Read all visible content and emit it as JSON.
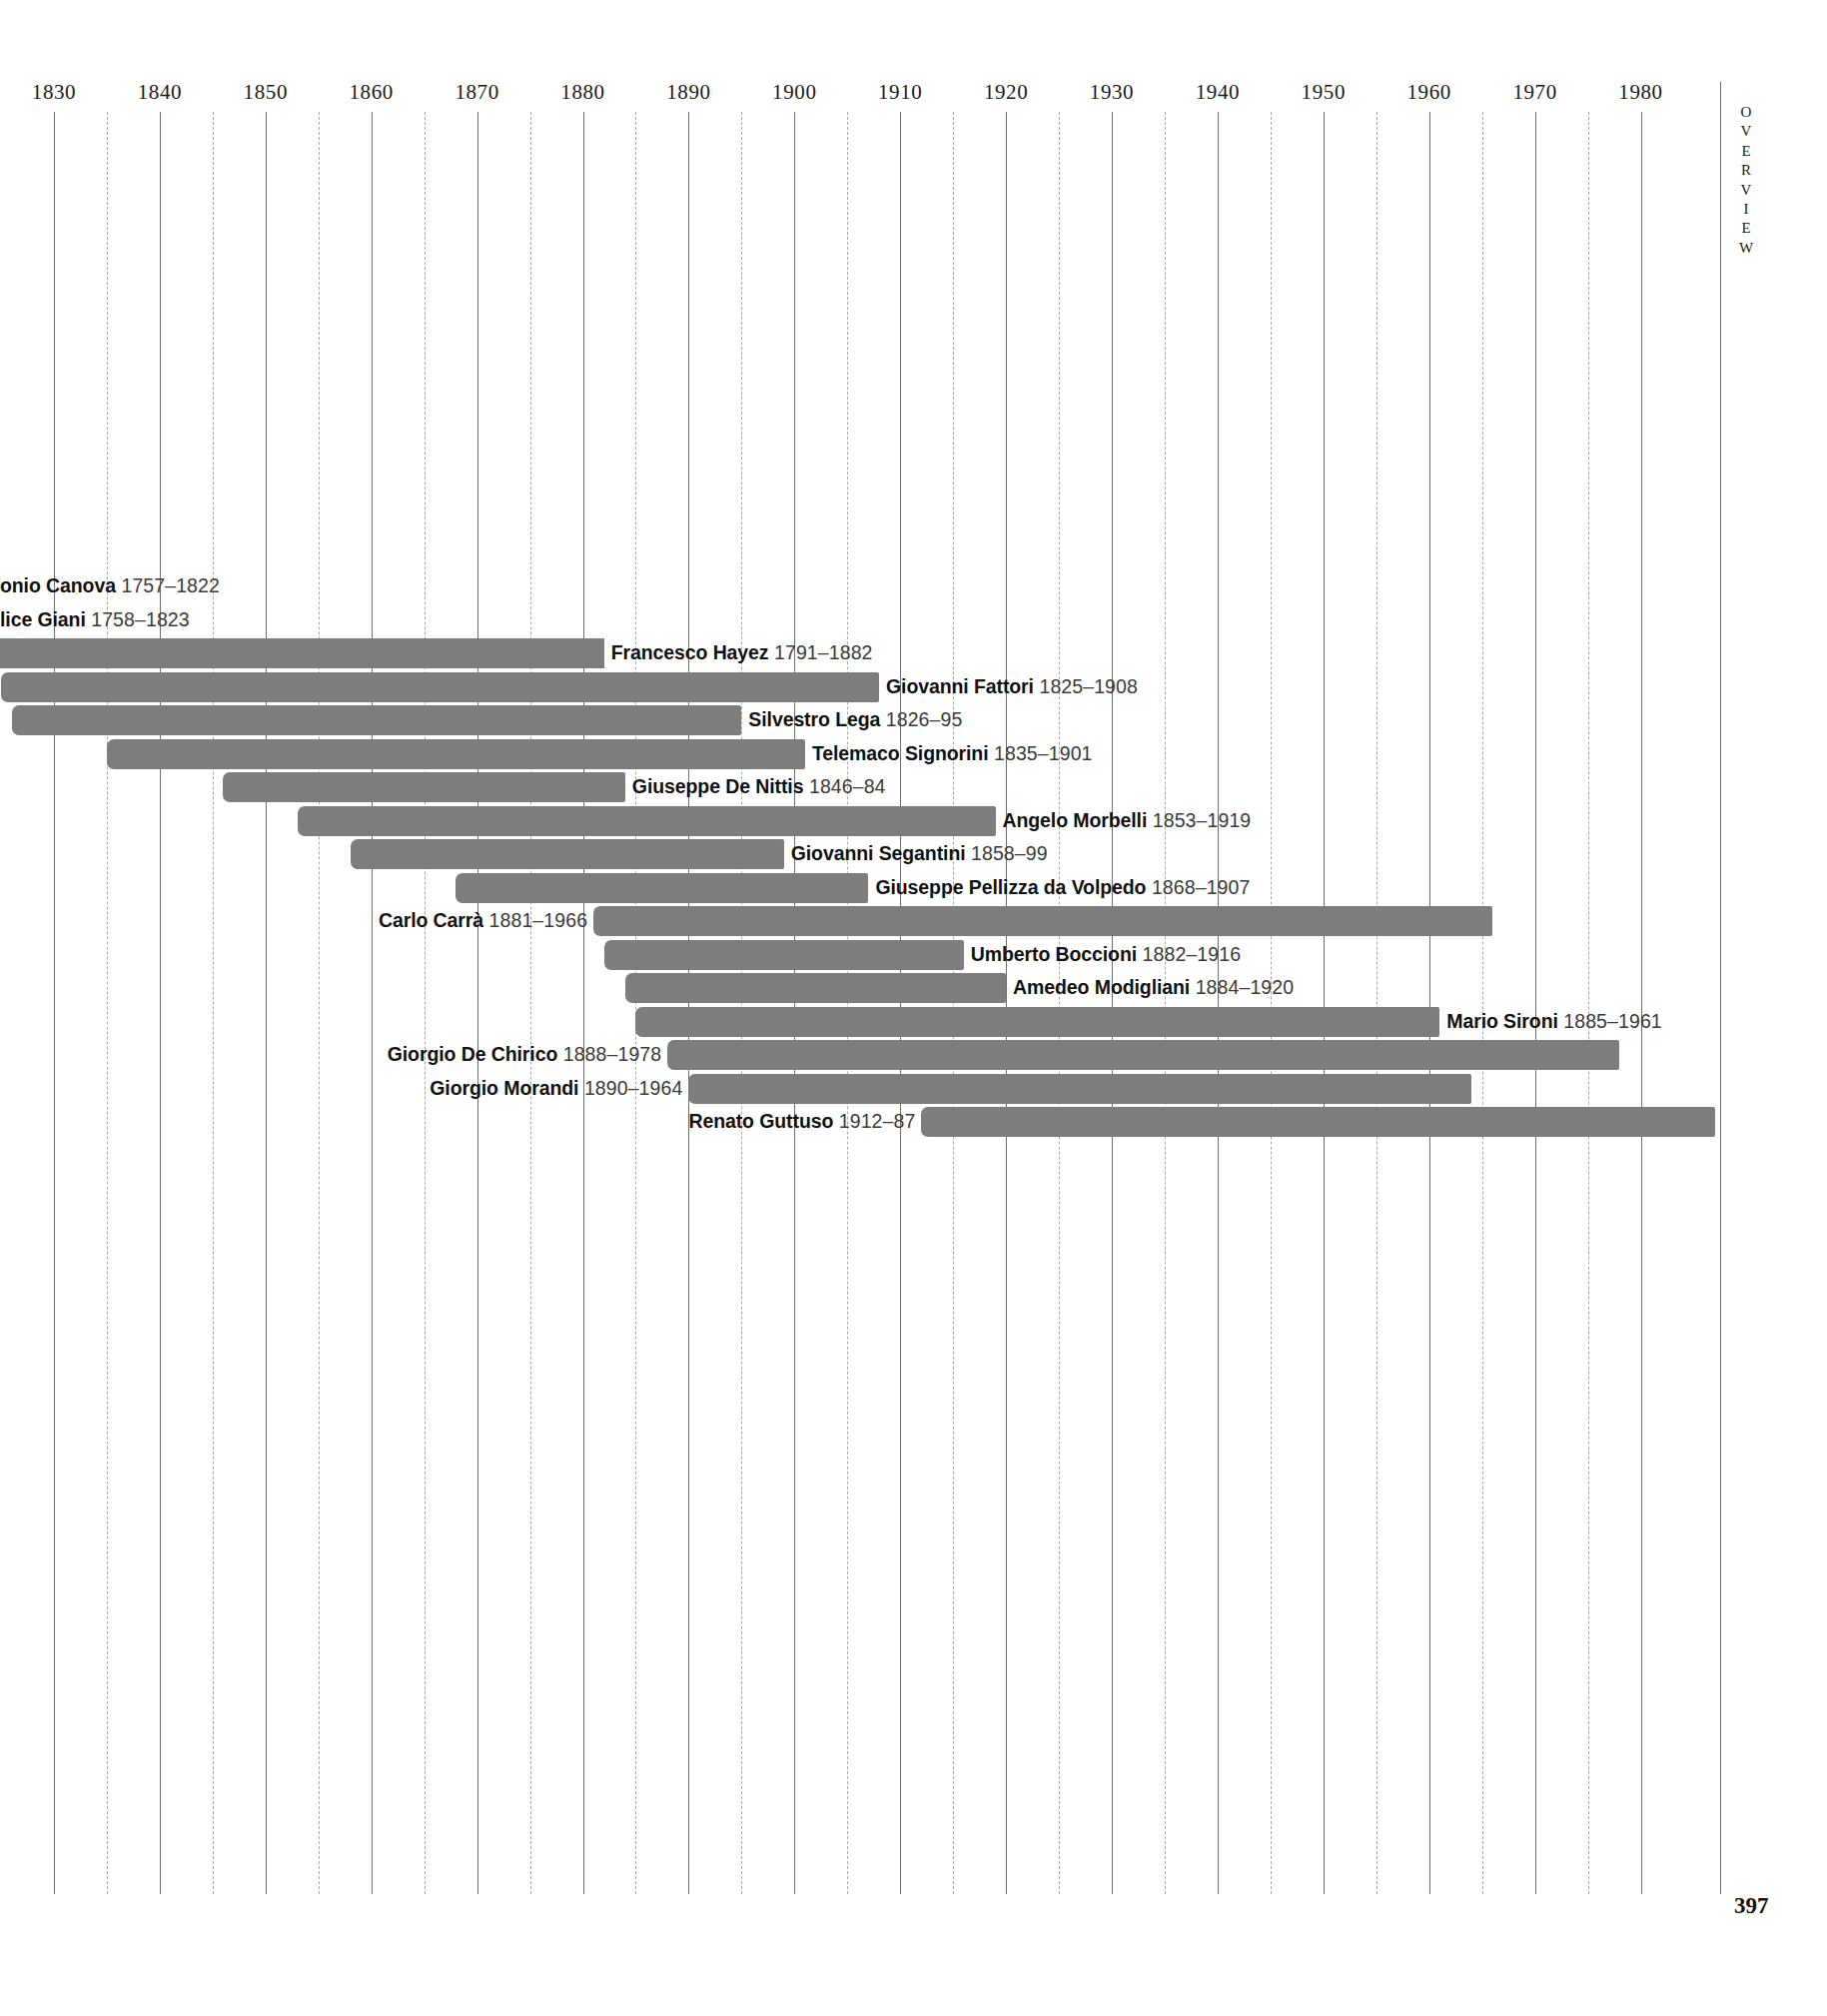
{
  "page": {
    "folio": "397",
    "running_head": "OVERVIEW"
  },
  "chart_data": {
    "type": "bar",
    "title": "",
    "subtitle": "",
    "xlabel": "",
    "ylabel": "",
    "orientation": "horizontal",
    "bar_meaning": "lifespan from birth year to death year",
    "grid": {
      "major_every": 10,
      "minor_every": 5,
      "major_style": "solid",
      "minor_style": "dashed"
    },
    "axis_ticks": [
      "1830",
      "1840",
      "1850",
      "1860",
      "1870",
      "1880",
      "1890",
      "1900",
      "1910",
      "1920",
      "1930",
      "1940",
      "1950",
      "1960",
      "1970",
      "1980"
    ],
    "axis_tick_values": [
      1830,
      1840,
      1850,
      1860,
      1870,
      1880,
      1890,
      1900,
      1910,
      1920,
      1930,
      1940,
      1950,
      1960,
      1970,
      1980
    ],
    "xlim": [
      1825,
      1990
    ],
    "legend": [],
    "categories": [
      "Antonio Canova",
      "Felice Giani",
      "Francesco Hayez",
      "Giovanni Fattori",
      "Silvestro Lega",
      "Telemaco Signorini",
      "Giuseppe De Nittis",
      "Angelo Morbelli",
      "Giovanni Segantini",
      "Giuseppe Pellizza da Volpedo",
      "Carlo Carrà",
      "Umberto Boccioni",
      "Amedeo Modigliani",
      "Mario Sironi",
      "Giorgio De Chirico",
      "Giorgio Morandi",
      "Renato Guttuso"
    ],
    "rows": [
      {
        "name": "Antonio Canova",
        "dates": "1757–1822",
        "start": 1757,
        "end": 1822,
        "label_side": "right",
        "label_clipped_left": true,
        "visible_text": "onio Canova"
      },
      {
        "name": "Felice Giani",
        "dates": "1758–1823",
        "start": 1758,
        "end": 1823,
        "label_side": "right",
        "label_clipped_left": true,
        "visible_text": "lice Giani"
      },
      {
        "name": "Francesco Hayez",
        "dates": "1791–1882",
        "start": 1791,
        "end": 1882,
        "label_side": "right",
        "label_clipped_left": false,
        "visible_text": "Francesco Hayez"
      },
      {
        "name": "Giovanni Fattori",
        "dates": "1825–1908",
        "start": 1825,
        "end": 1908,
        "label_side": "right",
        "label_clipped_left": false,
        "visible_text": "Giovanni Fattori"
      },
      {
        "name": "Silvestro Lega",
        "dates": "1826–95",
        "start": 1826,
        "end": 1895,
        "label_side": "right",
        "label_clipped_left": false,
        "visible_text": "Silvestro Lega"
      },
      {
        "name": "Telemaco Signorini",
        "dates": "1835–1901",
        "start": 1835,
        "end": 1901,
        "label_side": "right",
        "label_clipped_left": false,
        "visible_text": "Telemaco Signorini"
      },
      {
        "name": "Giuseppe De Nittis",
        "dates": "1846–84",
        "start": 1846,
        "end": 1884,
        "label_side": "right",
        "label_clipped_left": false,
        "visible_text": "Giuseppe De Nittis"
      },
      {
        "name": "Angelo Morbelli",
        "dates": "1853–1919",
        "start": 1853,
        "end": 1919,
        "label_side": "right",
        "label_clipped_left": false,
        "visible_text": "Angelo Morbelli"
      },
      {
        "name": "Giovanni Segantini",
        "dates": "1858–99",
        "start": 1858,
        "end": 1899,
        "label_side": "right",
        "label_clipped_left": false,
        "visible_text": "Giovanni Segantini"
      },
      {
        "name": "Giuseppe Pellizza da Volpedo",
        "dates": "1868–1907",
        "start": 1868,
        "end": 1907,
        "label_side": "right",
        "label_clipped_left": false,
        "visible_text": "Giuseppe Pellizza da Volpedo"
      },
      {
        "name": "Carlo Carrà",
        "dates": "1881–1966",
        "start": 1881,
        "end": 1966,
        "label_side": "left",
        "label_clipped_left": false,
        "visible_text": "Carlo Carrà"
      },
      {
        "name": "Umberto Boccioni",
        "dates": "1882–1916",
        "start": 1882,
        "end": 1916,
        "label_side": "right",
        "label_clipped_left": false,
        "visible_text": "Umberto Boccioni"
      },
      {
        "name": "Amedeo Modigliani",
        "dates": "1884–1920",
        "start": 1884,
        "end": 1920,
        "label_side": "right",
        "label_clipped_left": false,
        "visible_text": "Amedeo Modigliani"
      },
      {
        "name": "Mario Sironi",
        "dates": "1885–1961",
        "start": 1885,
        "end": 1961,
        "label_side": "right",
        "label_clipped_left": false,
        "visible_text": "Mario Sironi"
      },
      {
        "name": "Giorgio De Chirico",
        "dates": "1888–1978",
        "start": 1888,
        "end": 1978,
        "label_side": "left",
        "label_clipped_left": false,
        "visible_text": "Giorgio De Chirico"
      },
      {
        "name": "Giorgio Morandi",
        "dates": "1890–1964",
        "start": 1890,
        "end": 1964,
        "label_side": "left",
        "label_clipped_left": false,
        "visible_text": "Giorgio Morandi"
      },
      {
        "name": "Renato Guttuso",
        "dates": "1912–87",
        "start": 1912,
        "end": 1987,
        "label_side": "left",
        "label_clipped_left": false,
        "visible_text": "Renato Guttuso"
      }
    ]
  },
  "colors": {
    "bar": "#7d7d7d",
    "gridline_major": "#6e6e6e",
    "gridline_minor": "#a9a9a9",
    "text": "#1a1a1a",
    "background": "#ffffff"
  }
}
